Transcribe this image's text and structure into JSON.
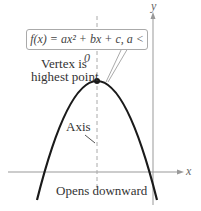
{
  "diagram": {
    "equation_label": "f(x) = ax² + bx + c, a < 0",
    "vertex_label_line1": "Vertex is",
    "vertex_label_line2": "highest point",
    "axis_label": "Axis",
    "opens_label": "Opens downward",
    "x_axis_label": "x",
    "y_axis_label": "y",
    "colors": {
      "curve": "#1a1a1a",
      "axes": "#888888",
      "dashed_axis": "#999999",
      "text": "#333333"
    }
  }
}
